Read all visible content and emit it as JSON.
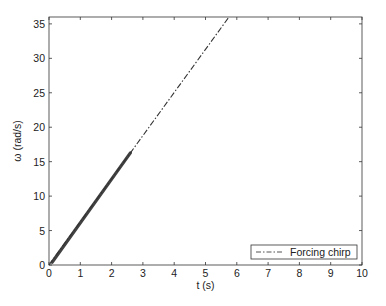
{
  "chart_data": {
    "type": "line",
    "title": "",
    "xlabel": "t (s)",
    "ylabel": "ω (rad/s)",
    "xlim": [
      0,
      10
    ],
    "ylim": [
      0,
      36
    ],
    "xticks": [
      0,
      1,
      2,
      3,
      4,
      5,
      6,
      7,
      8,
      9,
      10
    ],
    "yticks": [
      0,
      5,
      10,
      15,
      20,
      25,
      30,
      35
    ],
    "grid": false,
    "legend_position": "lower right",
    "series": [
      {
        "name": "Forcing chirp",
        "style": "dash-dot",
        "color": "#333333",
        "x": [
          0,
          1,
          2,
          3,
          4,
          5,
          5.75
        ],
        "y": [
          0,
          6.26,
          12.52,
          18.78,
          25.04,
          31.3,
          36
        ]
      }
    ]
  },
  "legend": {
    "entries": [
      "Forcing chirp"
    ]
  },
  "axes": {
    "xlabel": "t (s)",
    "ylabel": "ω (rad/s)"
  }
}
